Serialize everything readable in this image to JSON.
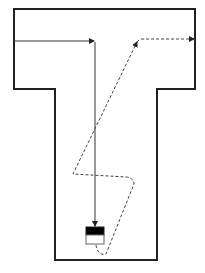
{
  "diagram": {
    "shape": "T-shaped enclosure",
    "paths": [
      {
        "name": "direct-path",
        "style": "solid",
        "description": "Enters from the left wall, goes right, then straight down to the target box"
      },
      {
        "name": "winding-path",
        "style": "dashed",
        "description": "Starts under the target box, zig-zags up through the stem and exits out the right arm of the T"
      }
    ],
    "target": {
      "name": "target-box",
      "top_fill": "black",
      "bottom_fill": "white"
    },
    "colors": {
      "stroke": "#222222",
      "path_solid": "#333333",
      "path_dashed": "#444444",
      "box_top": "#000000",
      "box_bottom": "#ffffff",
      "background": "#ffffff"
    }
  }
}
